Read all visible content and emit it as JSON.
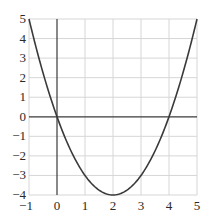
{
  "chart_data": {
    "type": "line",
    "title": "",
    "xlabel": "",
    "ylabel": "",
    "function": "y = x^2 - 4x",
    "xlim": [
      -1,
      5
    ],
    "ylim": [
      -4,
      5
    ],
    "grid": true,
    "legend": null,
    "x_ticks": [
      "-1",
      "0",
      "1",
      "2",
      "3",
      "4",
      "5"
    ],
    "y_ticks": [
      "5",
      "4",
      "3",
      "2",
      "1",
      "0",
      "-1",
      "-2",
      "-3",
      "-4"
    ],
    "series": [
      {
        "name": "parabola",
        "x": [
          -1,
          -0.5,
          0,
          0.5,
          1,
          1.5,
          2,
          2.5,
          3,
          3.5,
          4,
          4.5,
          5
        ],
        "y": [
          5,
          2.25,
          0,
          -1.75,
          -3,
          -3.75,
          -4,
          -3.75,
          -3,
          -1.75,
          0,
          2.25,
          5
        ]
      }
    ],
    "annotations": [
      {
        "label": "root",
        "x": 0,
        "y": 0
      },
      {
        "label": "root",
        "x": 4,
        "y": 0
      },
      {
        "label": "vertex",
        "x": 2,
        "y": -4
      }
    ]
  },
  "colors": {
    "curve": "#3a3a3a",
    "axis": "#3a3a3a",
    "grid": "#d6d6d6",
    "text": "#2a2a2a"
  }
}
